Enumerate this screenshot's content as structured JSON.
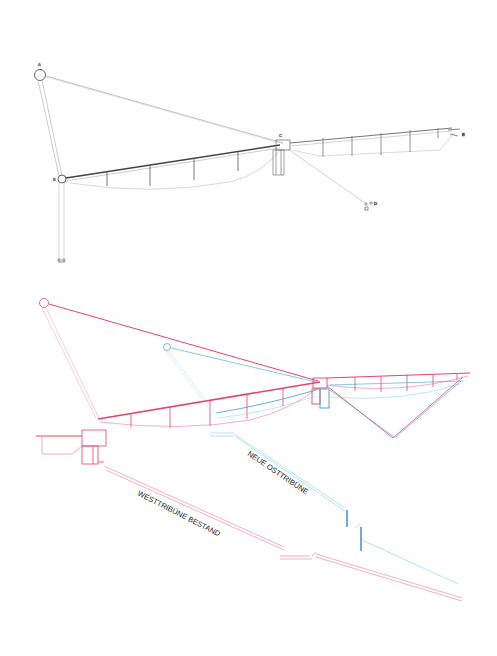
{
  "figure": {
    "top_section": {
      "description": "structural cross-section of cantilever roof (grey linework)",
      "color": "#8a8a8a",
      "dark_color": "#444444",
      "node_labels": {
        "a": "A",
        "b": "B",
        "c": "C",
        "d": "D",
        "e": "E"
      }
    },
    "bottom_section": {
      "description": "overlay of existing west stand and new east stand roof",
      "west_color": "#e8436b",
      "east_color": "#3a9fd6",
      "east_light_color": "#7fd3e6",
      "labels": {
        "east_stand": "NEUE OSTTRIBÜNE",
        "west_stand": "WESTTRIBÜNE BESTAND"
      }
    }
  }
}
